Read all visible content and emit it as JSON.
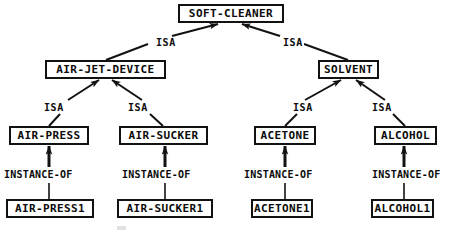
{
  "diagram": {
    "type": "tree",
    "ink_color": "#121212",
    "background_color": "#ffffff",
    "nodes": [
      {
        "id": "soft-cleaner",
        "label": "SOFT-CLEANER",
        "x": 178,
        "y": 4,
        "w": 106,
        "h": 19,
        "font_size": 11
      },
      {
        "id": "air-jet-device",
        "label": "AIR-JET-DEVICE",
        "x": 45,
        "y": 60,
        "w": 121,
        "h": 19,
        "font_size": 11
      },
      {
        "id": "solvent",
        "label": "SOLVENT",
        "x": 318,
        "y": 60,
        "w": 61,
        "h": 19,
        "font_size": 11
      },
      {
        "id": "air-press",
        "label": "AIR-PRESS",
        "x": 9,
        "y": 126,
        "w": 80,
        "h": 19,
        "font_size": 11
      },
      {
        "id": "air-sucker",
        "label": "AIR-SUCKER",
        "x": 119,
        "y": 126,
        "w": 89,
        "h": 19,
        "font_size": 11
      },
      {
        "id": "acetone",
        "label": "ACETONE",
        "x": 254,
        "y": 126,
        "w": 62,
        "h": 19,
        "font_size": 11
      },
      {
        "id": "alcohol",
        "label": "ALCOHOL",
        "x": 374,
        "y": 126,
        "w": 63,
        "h": 19,
        "font_size": 11
      },
      {
        "id": "air-press1",
        "label": "AIR-PRESS1",
        "x": 6,
        "y": 199,
        "w": 88,
        "h": 19,
        "font_size": 11
      },
      {
        "id": "air-sucker1",
        "label": "AIR-SUCKER1",
        "x": 117,
        "y": 199,
        "w": 96,
        "h": 19,
        "font_size": 11
      },
      {
        "id": "acetone1",
        "label": "ACETONE1",
        "x": 251,
        "y": 199,
        "w": 62,
        "h": 19,
        "font_size": 11
      },
      {
        "id": "alcohol1",
        "label": "ALCOHOL1",
        "x": 371,
        "y": 199,
        "w": 63,
        "h": 19,
        "font_size": 11
      }
    ],
    "edges": [
      {
        "from": "air-jet-device",
        "to": "soft-cleaner",
        "relation": "ISA",
        "label_x": 155,
        "label_y": 38
      },
      {
        "from": "solvent",
        "to": "soft-cleaner",
        "relation": "ISA",
        "label_x": 282,
        "label_y": 38
      },
      {
        "from": "air-press",
        "to": "air-jet-device",
        "relation": "ISA",
        "label_x": 43,
        "label_y": 103
      },
      {
        "from": "air-sucker",
        "to": "air-jet-device",
        "relation": "ISA",
        "label_x": 127,
        "label_y": 103
      },
      {
        "from": "acetone",
        "to": "solvent",
        "relation": "ISA",
        "label_x": 292,
        "label_y": 103
      },
      {
        "from": "alcohol",
        "to": "solvent",
        "relation": "ISA",
        "label_x": 371,
        "label_y": 103
      },
      {
        "from": "air-press1",
        "to": "air-press",
        "relation": "INSTANCE-OF",
        "label_x": 3,
        "label_y": 170
      },
      {
        "from": "air-sucker1",
        "to": "air-sucker",
        "relation": "INSTANCE-OF",
        "label_x": 121,
        "label_y": 170
      },
      {
        "from": "acetone1",
        "to": "acetone",
        "relation": "INSTANCE-OF",
        "label_x": 243,
        "label_y": 170
      },
      {
        "from": "alcohol1",
        "to": "alcohol",
        "relation": "INSTANCE-OF",
        "label_x": 371,
        "label_y": 170
      }
    ],
    "relation_labels": {
      "isa": "ISA",
      "instance_of": "INSTANCE-OF"
    }
  }
}
